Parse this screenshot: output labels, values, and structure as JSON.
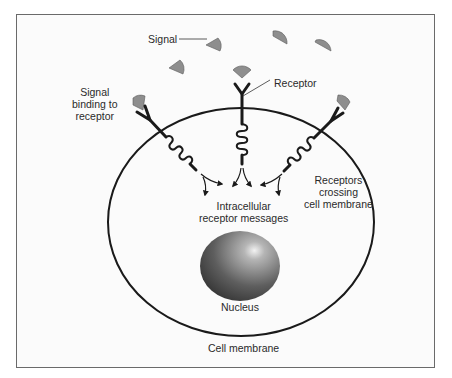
{
  "diagram": {
    "labels": {
      "signal": "Signal",
      "signal_binding": [
        "Signal",
        "binding to",
        "receptor"
      ],
      "receptor": "Receptor",
      "receptors_crossing": [
        "Receptors",
        "crossing",
        "cell membrane"
      ],
      "intracellular": [
        "Intracellular",
        "receptor messages"
      ],
      "nucleus": "Nucleus",
      "cell_membrane": "Cell membrane"
    },
    "colors": {
      "signal_fill": "#8e8e8e",
      "line": "#1a1a1a",
      "nucleus_dark": "#3a3a3a",
      "nucleus_light": "#e8e8e8",
      "frame_border": "#6a6a6a"
    }
  }
}
